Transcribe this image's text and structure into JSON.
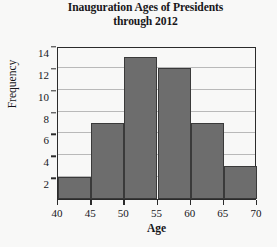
{
  "chart_data": {
    "type": "bar",
    "title": "Inauguration Ages of Presidents through 2012",
    "title_lines": [
      "Inauguration Ages of Presidents",
      "through 2012"
    ],
    "xlabel": "Age",
    "ylabel": "Frequency",
    "categories": [
      "40-45",
      "45-50",
      "50-55",
      "55-60",
      "60-65",
      "65-70"
    ],
    "bin_edges": [
      40,
      45,
      50,
      55,
      60,
      65,
      70
    ],
    "values": [
      2,
      7,
      13,
      12,
      7,
      3
    ],
    "xlim": [
      40,
      70
    ],
    "ylim": [
      0,
      14
    ],
    "xticks": [
      40,
      45,
      50,
      55,
      60,
      65,
      70
    ],
    "yticks": [
      2,
      4,
      6,
      8,
      10,
      12,
      14
    ],
    "grid": "horizontal",
    "legend": "none",
    "bar_color": "#6d6d6d",
    "bar_edge_color": "#3a3a3a",
    "grid_color": "#b9b9b9",
    "axis_color": "#2b2b2b",
    "background_color": "#f8f8f7"
  }
}
